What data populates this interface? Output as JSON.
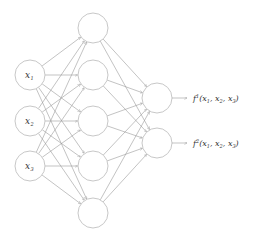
{
  "diagram": {
    "title": "",
    "type": "feedforward-neural-network",
    "colors": {
      "node_stroke": "#c8c8c8",
      "edge": "#9a9a9a",
      "text": "#333333",
      "background": "#ffffff"
    },
    "node_radius": 15,
    "layers": [
      {
        "name": "input",
        "x": 30,
        "nodes": [
          {
            "y": 75,
            "label": "x",
            "sub": "1"
          },
          {
            "y": 121,
            "label": "x",
            "sub": "2"
          },
          {
            "y": 166,
            "label": "x",
            "sub": "3"
          }
        ]
      },
      {
        "name": "hidden",
        "x": 93,
        "nodes": [
          {
            "y": 28
          },
          {
            "y": 75
          },
          {
            "y": 121
          },
          {
            "y": 166
          },
          {
            "y": 213
          }
        ]
      },
      {
        "name": "output",
        "x": 157,
        "nodes": [
          {
            "y": 98
          },
          {
            "y": 143
          }
        ]
      }
    ],
    "outputs": [
      {
        "y": 98,
        "fname": "f",
        "sup": "1",
        "args": [
          {
            "v": "x",
            "s": "1"
          },
          {
            "v": "x",
            "s": "2"
          },
          {
            "v": "x",
            "s": "3"
          }
        ]
      },
      {
        "y": 143,
        "fname": "f",
        "sup": "2",
        "args": [
          {
            "v": "x",
            "s": "1"
          },
          {
            "v": "x",
            "s": "2"
          },
          {
            "v": "x",
            "s": "3"
          }
        ]
      }
    ]
  }
}
